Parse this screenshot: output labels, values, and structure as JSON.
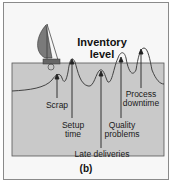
{
  "diagram": {
    "title_line1": "Inventory",
    "title_line2": "level",
    "caption": "(b)",
    "water_color": "#c8c8c8",
    "rock_color": "#d4d4d4",
    "sail_color": "#7a7a7a",
    "problems": [
      {
        "label": "Scrap"
      },
      {
        "label_line1": "Setup",
        "label_line2": "time"
      },
      {
        "label": "Late deliveries"
      },
      {
        "label_line1": "Quality",
        "label_line2": "problems"
      },
      {
        "label_line1": "Process",
        "label_line2": "downtime"
      }
    ]
  }
}
